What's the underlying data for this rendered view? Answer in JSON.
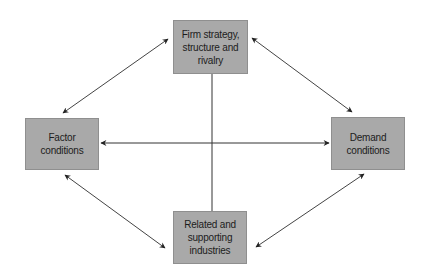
{
  "diagram": {
    "type": "porter-diamond",
    "nodes": {
      "top": {
        "label": "Firm strategy,\nstructure and\nrivalry"
      },
      "left": {
        "label": "Factor\nconditions"
      },
      "right": {
        "label": "Demand\nconditions"
      },
      "bottom": {
        "label": "Related and\nsupporting\nindustries"
      }
    },
    "edges": [
      {
        "from": "left",
        "to": "top",
        "style": "double-arrow"
      },
      {
        "from": "top",
        "to": "right",
        "style": "double-arrow"
      },
      {
        "from": "left",
        "to": "bottom",
        "style": "double-arrow"
      },
      {
        "from": "bottom",
        "to": "right",
        "style": "double-arrow"
      },
      {
        "from": "left",
        "to": "right",
        "style": "double-arrow"
      },
      {
        "from": "top",
        "to": "bottom",
        "style": "line"
      }
    ],
    "colors": {
      "box_fill": "#a9a9a9",
      "box_border": "#8f8f8f",
      "line": "#333333",
      "text": "#1c1c1c"
    }
  }
}
